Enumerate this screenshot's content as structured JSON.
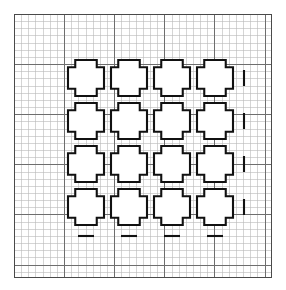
{
  "figure": {
    "title": "",
    "background_color": "#ffffff"
  },
  "panel": {
    "name": "graph-paper-panel",
    "x": 14.5,
    "y": 14.5,
    "width": 257,
    "height": 263,
    "border_color": "#4a4a4a",
    "border_width": 1.6,
    "fill_color": "#ffffff"
  },
  "grid": {
    "minor": {
      "cell_size": 7.16,
      "color": "#b9b9b9",
      "line_width": 0.6,
      "columns": 36,
      "rows": 37
    },
    "major": {
      "every_n_cells": 7,
      "color": "#6e6e6e",
      "line_width": 1.0
    }
  },
  "cross_array": {
    "name": "cross-array",
    "rows": 4,
    "columns": 4,
    "count": 16,
    "origin_x": 68,
    "origin_y": 60,
    "pitch_x": 43,
    "pitch_y": 43,
    "cross": {
      "outer_size": 36,
      "arm_width": 21.5,
      "stroke_color": "#111111",
      "stroke_width": 2.1,
      "fill_color": "#ffffff"
    }
  },
  "tick_marks": {
    "name": "tick-marks",
    "color": "#111111",
    "line_width": 2.1,
    "bottom": {
      "count": 4,
      "length": 16,
      "y_offset": 11
    },
    "right": {
      "count": 4,
      "length": 16,
      "x_offset": 11
    }
  },
  "chart_data": {
    "type": "diagram",
    "title": "",
    "xlabel": "",
    "ylabel": "",
    "grid": true,
    "legend": null,
    "shape": "plus-cross outline",
    "array_rows": 4,
    "array_columns": 4,
    "total_shapes": 16,
    "grid_cell_units": 1,
    "cross_span_cells": 5,
    "cross_arm_cells": 3,
    "cross_pitch_cells": 6,
    "annotations": []
  }
}
